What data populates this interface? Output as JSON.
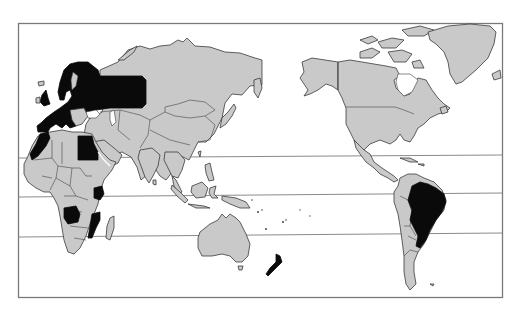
{
  "map": {
    "type": "world choropleth (Pacific-centered projection)",
    "frame": {
      "x": 18,
      "y": 23,
      "width": 484,
      "height": 274
    },
    "latitude_lines": [
      {
        "name": "tropic-of-cancer",
        "y_left": 158,
        "y_right": 155
      },
      {
        "name": "equator",
        "y_left": 197,
        "y_right": 193
      },
      {
        "name": "tropic-of-capricorn",
        "y_left": 237,
        "y_right": 233
      }
    ],
    "colors": {
      "background": "#ffffff",
      "land_default": "#c9c9c9",
      "land_highlighted": "#0a0a0a",
      "outline": "#3a3a3a",
      "frame": "#7a7a7a"
    },
    "highlighted_regions": [
      "Europe (incl. Scandinavia, UK, Western & Central Europe, European Russia)",
      "Egypt",
      "Morocco / Western Sahara coast",
      "Kenya",
      "Angola",
      "Mozambique",
      "Brazil",
      "New Zealand"
    ],
    "unhighlighted_regions": [
      "Rest of Asia",
      "Rest of Africa",
      "Australia",
      "Indonesia & SE Asia",
      "North America",
      "Greenland",
      "Central America",
      "Rest of South America",
      "Madagascar"
    ]
  }
}
